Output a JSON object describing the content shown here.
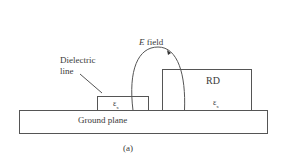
{
  "diagram": {
    "labels": {
      "e_field": "E field",
      "e_field_italic": "E",
      "e_field_rest": " field",
      "dielectric_line_1": "Dielectric",
      "dielectric_line_2": "line",
      "rd": "RD",
      "ground_plane": "Ground plane",
      "eps_symbol": "ε",
      "eps_sub": "x",
      "caption": "(a)"
    },
    "colors": {
      "stroke": "#555555",
      "text": "#3a3a3a",
      "background": "#ffffff"
    }
  }
}
